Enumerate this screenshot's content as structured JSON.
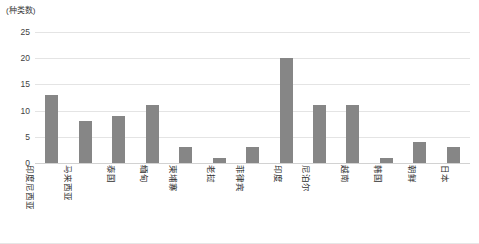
{
  "chart_data": {
    "type": "bar",
    "title": "",
    "subtitle": "",
    "xlabel": "",
    "ylabel": "(种类数)",
    "ylim": [
      0,
      25
    ],
    "ytick_labels": [
      "25",
      "20",
      "15",
      "10",
      "5",
      "0"
    ],
    "ytick_values": [
      25,
      20,
      15,
      10,
      5,
      0
    ],
    "grid": true,
    "legend": "none",
    "bar_color": "#868686",
    "gridline_color": "#e4e4e4",
    "categories": [
      "印度尼西亚",
      "马来西亚",
      "泰国",
      "缅甸",
      "柬埔寨",
      "老挝",
      "菲律宾",
      "印度",
      "尼泊尔",
      "越南",
      "韩国",
      "朝鲜",
      "日本"
    ],
    "values": [
      13,
      8,
      9,
      11,
      3,
      1,
      3,
      20,
      11,
      11,
      1,
      4,
      3
    ]
  }
}
